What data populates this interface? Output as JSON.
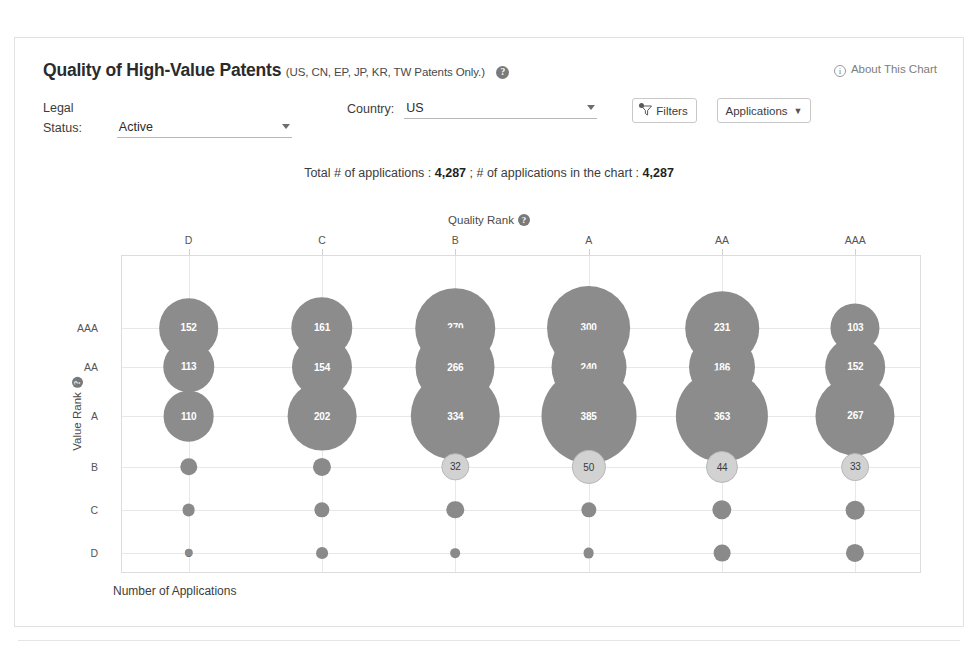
{
  "scan": {
    "top_artifact": ""
  },
  "header": {
    "title": "Quality of High-Value Patents",
    "subtitle": "(US, CN, EP, JP, KR, TW Patents Only.)",
    "help_icon": "?",
    "about_link": "About This Chart",
    "info_icon": "i"
  },
  "controls": {
    "legal_status": {
      "label": "Legal Status:",
      "value": "Active"
    },
    "country": {
      "label": "Country:",
      "value": "US"
    },
    "filters_button": "Filters",
    "applications_button": "Applications"
  },
  "totals": {
    "prefix": "Total # of applications : ",
    "total": "4,287",
    "middle": " ; # of applications in the chart : ",
    "in_chart": "4,287"
  },
  "chart_data": {
    "type": "heatmap",
    "title": "Quality Rank",
    "xlabel": "Number of Applications",
    "ylabel": "Value Rank",
    "x_axis_title": "Quality Rank",
    "categories_x": [
      "D",
      "C",
      "B",
      "A",
      "AA",
      "AAA"
    ],
    "categories_y": [
      "AAA",
      "AA",
      "A",
      "B",
      "C",
      "D"
    ],
    "grid": true,
    "legend": "none",
    "colors": {
      "large_bubble": "#8c8c8c",
      "small_bubble": "#d2d2d2",
      "grid": "#e8e8e8"
    },
    "series": [
      {
        "name": "AAA",
        "values": [
          152,
          161,
          270,
          300,
          231,
          103
        ]
      },
      {
        "name": "AA",
        "values": [
          113,
          154,
          266,
          240,
          186,
          152
        ]
      },
      {
        "name": "A",
        "values": [
          110,
          202,
          334,
          385,
          363,
          267
        ]
      },
      {
        "name": "B",
        "values": [
          13,
          14,
          32,
          50,
          44,
          33
        ]
      },
      {
        "name": "C",
        "values": [
          7,
          10,
          13,
          10,
          16,
          15
        ]
      },
      {
        "name": "D",
        "values": [
          3,
          6,
          4,
          5,
          12,
          14
        ]
      }
    ]
  }
}
